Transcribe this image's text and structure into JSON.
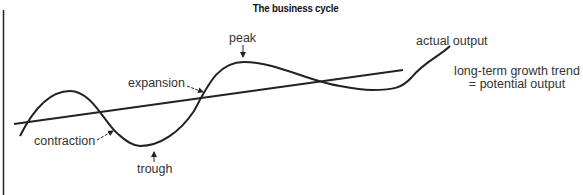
{
  "title": "The business cycle",
  "labels": {
    "peak": "peak",
    "trough": "trough",
    "expansion": "expansion",
    "contraction": "contraction",
    "actual_output": "actual output",
    "trend_line1": "long-term growth trend",
    "trend_line2": "= potential output"
  },
  "colors": {
    "line": "#222222",
    "text": "#333333",
    "background": "#ffffff"
  },
  "series": {
    "trend": {
      "name": "long-term growth trend = potential output",
      "from": [
        14,
        124
      ],
      "to": [
        403,
        70
      ]
    },
    "actual_output": {
      "name": "actual output",
      "key_points": [
        {
          "label": "start",
          "x": 20,
          "y": 136
        },
        {
          "label": "local peak",
          "x": 70,
          "y": 91
        },
        {
          "label": "trough",
          "x": 140,
          "y": 146
        },
        {
          "label": "peak",
          "x": 244,
          "y": 62
        },
        {
          "label": "local min",
          "x": 372,
          "y": 90
        },
        {
          "label": "end",
          "x": 450,
          "y": 46
        }
      ]
    }
  }
}
